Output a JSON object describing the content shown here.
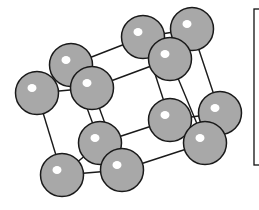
{
  "diagram": {
    "title": "",
    "type": "crystal-lattice",
    "atom_color": "#a8a8a8",
    "outline_color": "#1a1a1a",
    "atoms": [
      {
        "id": "A",
        "x": 71,
        "y": 65
      },
      {
        "id": "D",
        "x": 143,
        "y": 37
      },
      {
        "id": "E",
        "x": 192,
        "y": 29
      },
      {
        "id": "B",
        "x": 37,
        "y": 93
      },
      {
        "id": "C",
        "x": 92,
        "y": 88
      },
      {
        "id": "F",
        "x": 170,
        "y": 59
      },
      {
        "id": "H",
        "x": 220,
        "y": 113
      },
      {
        "id": "G",
        "x": 170,
        "y": 120
      },
      {
        "id": "J",
        "x": 100,
        "y": 143
      },
      {
        "id": "I",
        "x": 205,
        "y": 143
      },
      {
        "id": "L",
        "x": 62,
        "y": 175
      },
      {
        "id": "K",
        "x": 122,
        "y": 170
      }
    ],
    "bonds": [
      [
        "A",
        "D"
      ],
      [
        "C",
        "F"
      ],
      [
        "D",
        "E"
      ],
      [
        "A",
        "C"
      ],
      [
        "B",
        "C"
      ],
      [
        "B",
        "L"
      ],
      [
        "L",
        "K"
      ],
      [
        "J",
        "K"
      ],
      [
        "J",
        "G"
      ],
      [
        "K",
        "I"
      ],
      [
        "G",
        "I"
      ],
      [
        "E",
        "H"
      ],
      [
        "F",
        "I"
      ],
      [
        "D",
        "G"
      ],
      [
        "A",
        "J"
      ],
      [
        "C",
        "K"
      ],
      [
        "H",
        "I"
      ],
      [
        "F",
        "E"
      ],
      [
        "G",
        "H"
      ],
      [
        "B",
        "A"
      ],
      [
        "L",
        "J"
      ]
    ]
  }
}
